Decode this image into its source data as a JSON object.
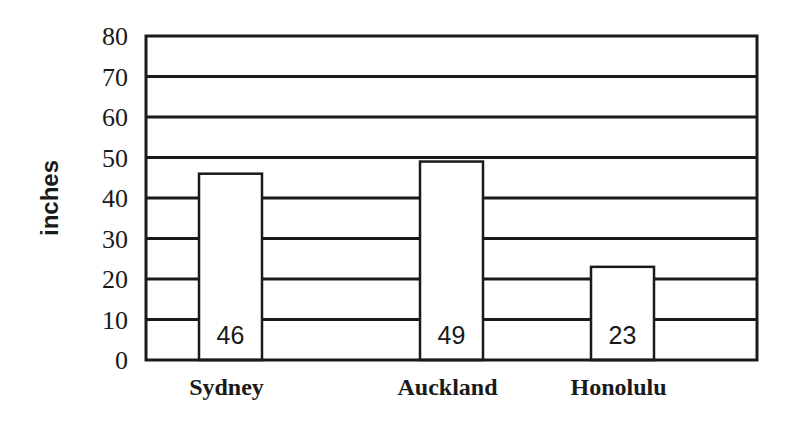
{
  "chart_data": {
    "type": "bar",
    "title": "",
    "xlabel": "",
    "ylabel": "inches",
    "ylim": [
      0,
      80
    ],
    "yticks": [
      0,
      10,
      20,
      30,
      40,
      50,
      60,
      70,
      80
    ],
    "categories": [
      "Sydney",
      "Auckland",
      "Honolulu"
    ],
    "values": [
      46,
      49,
      23
    ],
    "data_labels": [
      "46",
      "49",
      "23"
    ],
    "grid": true,
    "legend": null
  },
  "colors": {
    "ink": "#1a1a1a",
    "bar_fill": "#ffffff",
    "background": "#ffffff"
  }
}
